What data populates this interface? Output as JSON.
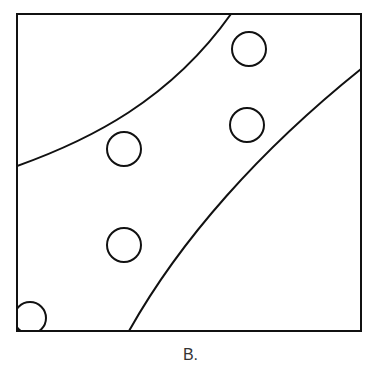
{
  "figure": {
    "caption": "B.",
    "stroke_color": "#111111",
    "background": "#ffffff",
    "frame": {
      "x": 17,
      "y": 14,
      "width": 344,
      "height": 317
    },
    "curves": [
      {
        "name": "upper-boundary",
        "path": "M17,166 C90,140 170,100 231,14"
      },
      {
        "name": "lower-boundary",
        "path": "M129,331 C180,240 260,150 361,69"
      }
    ],
    "circles": [
      {
        "name": "circle-top-right",
        "cx": 249,
        "cy": 49,
        "r": 17
      },
      {
        "name": "circle-mid-right",
        "cx": 247,
        "cy": 125,
        "r": 17
      },
      {
        "name": "circle-mid-left",
        "cx": 124,
        "cy": 149,
        "r": 17
      },
      {
        "name": "circle-low-left",
        "cx": 124,
        "cy": 245,
        "r": 17
      },
      {
        "name": "circle-corner-partial",
        "cx": 30,
        "cy": 318,
        "r": 16
      }
    ]
  }
}
